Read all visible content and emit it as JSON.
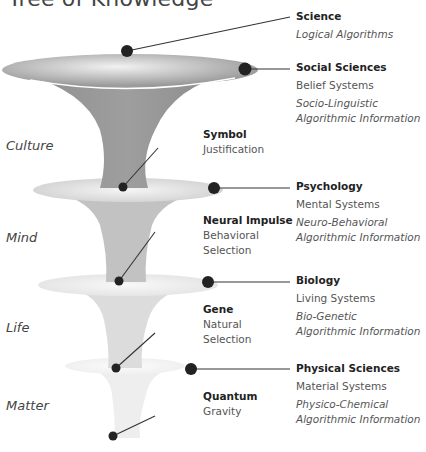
{
  "title": "Tree of Knowledge",
  "levels": [
    {
      "name": "Culture"
    },
    {
      "name": "Mind"
    },
    {
      "name": "Life"
    },
    {
      "name": "Matter"
    }
  ],
  "inner_labels": [
    {
      "heading": "Symbol",
      "lines": [
        "Justification"
      ]
    },
    {
      "heading": "Neural Impulse",
      "lines": [
        "Behavioral",
        "Selection"
      ]
    },
    {
      "heading": "Gene",
      "lines": [
        "Natural",
        "Selection"
      ]
    },
    {
      "heading": "Quantum",
      "lines": [
        "Gravity"
      ]
    }
  ],
  "science": {
    "heading": "Science",
    "subtitle": "Logical Algorithms"
  },
  "domains": [
    {
      "heading": "Social Sciences",
      "system": "Belief Systems",
      "info_line1": "Socio-Linguistic",
      "info_line2": "Algorithmic Information"
    },
    {
      "heading": "Psychology",
      "system": "Mental Systems",
      "info_line1": "Neuro-Behavioral",
      "info_line2": "Algorithmic Information"
    },
    {
      "heading": "Biology",
      "system": "Living Systems",
      "info_line1": "Bio-Genetic",
      "info_line2": "Algorithmic Information"
    },
    {
      "heading": "Physical Sciences",
      "system": "Material Systems",
      "info_line1": "Physico-Chemical",
      "info_line2": "Algorithmic Information"
    }
  ],
  "colors": {
    "dot": "#222222",
    "line": "#333333",
    "culture_funnel": "#9a9a9a",
    "mind_funnel": "#bdbdbd",
    "life_funnel": "#dadada",
    "matter_funnel": "#ececec"
  }
}
